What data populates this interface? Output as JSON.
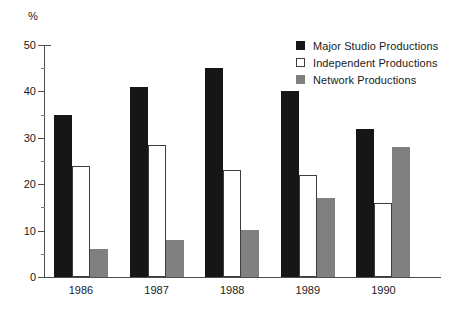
{
  "chart_data": {
    "type": "bar",
    "title": "",
    "xlabel": "",
    "ylabel": "%",
    "ylim": [
      0,
      50
    ],
    "ytick_step": 10,
    "yminor_step": 5,
    "grid": false,
    "legend_position": "top-right",
    "categories": [
      "1986",
      "1987",
      "1988",
      "1989",
      "1990"
    ],
    "ytick_labels": [
      "50",
      "40",
      "30",
      "20",
      "10",
      "0"
    ],
    "series": [
      {
        "name": "Major Studio Productions",
        "color": "#161616",
        "swatch": "filled-black",
        "values": [
          35,
          41,
          45,
          40,
          32
        ]
      },
      {
        "name": "Independent Productions",
        "color": "#ffffff",
        "swatch": "outlined-white",
        "values": [
          24,
          28.5,
          23,
          22,
          16
        ]
      },
      {
        "name": "Network Productions",
        "color": "#808080",
        "swatch": "filled-gray",
        "values": [
          6,
          8,
          10.2,
          17,
          28
        ]
      }
    ]
  }
}
